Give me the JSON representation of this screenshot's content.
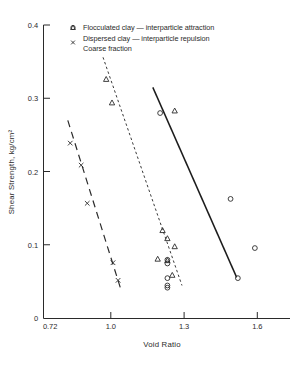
{
  "chart_data": {
    "type": "scatter",
    "title": "",
    "xlabel": "Void Ratio",
    "ylabel": "Shear Strength, kg/cm²",
    "xlim": [
      0.72,
      1.72
    ],
    "ylim": [
      0,
      0.4
    ],
    "xticks": [
      "0.72",
      "1.0",
      "1.3",
      "1.6"
    ],
    "xtick_values": [
      0.72,
      1.0,
      1.3,
      1.6
    ],
    "yticks": [
      "0",
      "0.1",
      "0.2",
      "0.3",
      "0.4"
    ],
    "ytick_values": [
      0,
      0.1,
      0.2,
      0.3,
      0.4
    ],
    "grid": false,
    "legend_position": "top-center",
    "legend": [
      {
        "marker": "circle-open",
        "label": "Flocculated  clay — interparticle  attraction"
      },
      {
        "marker": "triangle-open",
        "label": "Dispersed  clay — interparticle  repulsion"
      },
      {
        "marker": "x-cross",
        "label": "Coarse  fraction"
      }
    ],
    "series": [
      {
        "name": "Flocculated clay - interparticle attraction",
        "marker": "circle-open",
        "points": [
          {
            "x": 1.2,
            "y": 0.28
          },
          {
            "x": 1.49,
            "y": 0.163
          },
          {
            "x": 1.23,
            "y": 0.08
          },
          {
            "x": 1.59,
            "y": 0.096
          },
          {
            "x": 1.23,
            "y": 0.075
          },
          {
            "x": 1.23,
            "y": 0.055
          },
          {
            "x": 1.52,
            "y": 0.055
          },
          {
            "x": 1.23,
            "y": 0.045
          },
          {
            "x": 1.23,
            "y": 0.042
          }
        ],
        "trendline": {
          "style": "solid",
          "x1": 1.17,
          "y1": 0.315,
          "x2": 1.515,
          "y2": 0.056
        }
      },
      {
        "name": "Dispersed clay - interparticle repulsion",
        "marker": "triangle-open",
        "points": [
          {
            "x": 0.978,
            "y": 0.326
          },
          {
            "x": 1.002,
            "y": 0.294
          },
          {
            "x": 1.26,
            "y": 0.283
          },
          {
            "x": 1.21,
            "y": 0.12
          },
          {
            "x": 1.23,
            "y": 0.109
          },
          {
            "x": 1.26,
            "y": 0.098
          },
          {
            "x": 1.19,
            "y": 0.081
          },
          {
            "x": 1.23,
            "y": 0.079
          },
          {
            "x": 1.25,
            "y": 0.059
          }
        ],
        "trendline": {
          "style": "dotted",
          "x1": 0.965,
          "y1": 0.356,
          "x2": 1.29,
          "y2": 0.045
        }
      },
      {
        "name": "Coarse fraction",
        "marker": "x-cross",
        "points": [
          {
            "x": 0.83,
            "y": 0.239
          },
          {
            "x": 0.875,
            "y": 0.209
          },
          {
            "x": 0.9,
            "y": 0.157
          },
          {
            "x": 1.006,
            "y": 0.076
          },
          {
            "x": 1.027,
            "y": 0.052
          }
        ],
        "trendline": {
          "style": "dashed",
          "x1": 0.82,
          "y1": 0.27,
          "x2": 1.04,
          "y2": 0.038
        }
      }
    ]
  }
}
